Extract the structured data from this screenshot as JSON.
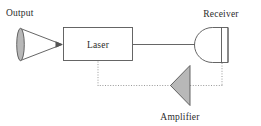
{
  "diagram": {
    "type": "block-diagram",
    "background_color": "#ffffff",
    "line_color": "#555555",
    "dotted_line_color": "#8d8d8d",
    "fill_color": "#b8b8b8",
    "text_color": "#2b2b2b",
    "nodes": [
      {
        "id": "output",
        "label": "Output",
        "shape": "ellipse-beam-cone",
        "label_position": "above-left"
      },
      {
        "id": "laser",
        "label": "Laser",
        "shape": "rectangle",
        "label_position": "inside"
      },
      {
        "id": "receiver",
        "label": "Receiver",
        "shape": "d-shape-detector",
        "label_position": "above"
      },
      {
        "id": "amplifier",
        "label": "Amplifier",
        "shape": "triangle-left",
        "label_position": "below"
      }
    ],
    "connections": [
      {
        "id": "laser-to-output",
        "from": "laser",
        "to": "output",
        "style": "solid-cone",
        "arrow": true
      },
      {
        "id": "laser-to-receiver",
        "from": "laser",
        "to": "receiver",
        "style": "solid",
        "arrow": true
      },
      {
        "id": "receiver-to-amplifier",
        "from": "receiver",
        "to": "amplifier",
        "style": "dotted",
        "arrow": false
      },
      {
        "id": "amplifier-to-laser",
        "from": "amplifier",
        "to": "laser",
        "style": "dotted",
        "arrow": false
      }
    ]
  }
}
